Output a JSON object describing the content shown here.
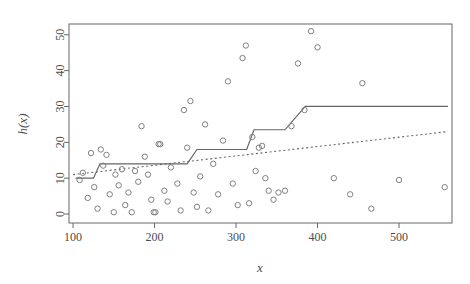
{
  "chart_data": {
    "type": "scatter",
    "title": "",
    "xlabel": "x",
    "ylabel": "h(x)",
    "xlim": [
      95,
      565
    ],
    "ylim": [
      -2.5,
      53
    ],
    "xticks": [
      100,
      200,
      300,
      400,
      500
    ],
    "yticks": [
      0,
      10,
      20,
      30,
      40,
      50
    ],
    "grid": false,
    "legend": null,
    "box": true,
    "point_symbol": "open-circle",
    "point_color": "#808080",
    "points": [
      {
        "x": 108,
        "y": 9.5
      },
      {
        "x": 112,
        "y": 11.5
      },
      {
        "x": 118,
        "y": 4.5
      },
      {
        "x": 122,
        "y": 17.0
      },
      {
        "x": 126,
        "y": 7.5
      },
      {
        "x": 130,
        "y": 1.5
      },
      {
        "x": 134,
        "y": 18.0
      },
      {
        "x": 137,
        "y": 13.5
      },
      {
        "x": 141,
        "y": 16.5
      },
      {
        "x": 145,
        "y": 5.5
      },
      {
        "x": 150,
        "y": 0.5
      },
      {
        "x": 152,
        "y": 11.0
      },
      {
        "x": 156,
        "y": 8.0
      },
      {
        "x": 160,
        "y": 12.5
      },
      {
        "x": 164,
        "y": 2.5
      },
      {
        "x": 168,
        "y": 6.0
      },
      {
        "x": 172,
        "y": 0.5
      },
      {
        "x": 176,
        "y": 12.0
      },
      {
        "x": 180,
        "y": 9.0
      },
      {
        "x": 184,
        "y": 24.5
      },
      {
        "x": 188,
        "y": 16.0
      },
      {
        "x": 192,
        "y": 11.0
      },
      {
        "x": 196,
        "y": 4.0
      },
      {
        "x": 199,
        "y": 0.5
      },
      {
        "x": 201,
        "y": 0.5
      },
      {
        "x": 205,
        "y": 19.5
      },
      {
        "x": 207,
        "y": 19.5
      },
      {
        "x": 212,
        "y": 6.5
      },
      {
        "x": 216,
        "y": 3.5
      },
      {
        "x": 220,
        "y": 13.0
      },
      {
        "x": 228,
        "y": 8.5
      },
      {
        "x": 232,
        "y": 1.0
      },
      {
        "x": 236,
        "y": 29.0
      },
      {
        "x": 240,
        "y": 18.5
      },
      {
        "x": 244,
        "y": 31.5
      },
      {
        "x": 248,
        "y": 6.0
      },
      {
        "x": 252,
        "y": 2.0
      },
      {
        "x": 256,
        "y": 10.5
      },
      {
        "x": 262,
        "y": 25.0
      },
      {
        "x": 266,
        "y": 1.0
      },
      {
        "x": 272,
        "y": 14.0
      },
      {
        "x": 278,
        "y": 5.5
      },
      {
        "x": 284,
        "y": 20.5
      },
      {
        "x": 290,
        "y": 37.0
      },
      {
        "x": 296,
        "y": 8.5
      },
      {
        "x": 302,
        "y": 2.5
      },
      {
        "x": 308,
        "y": 43.5
      },
      {
        "x": 312,
        "y": 47.0
      },
      {
        "x": 316,
        "y": 3.0
      },
      {
        "x": 320,
        "y": 21.5
      },
      {
        "x": 324,
        "y": 12.0
      },
      {
        "x": 328,
        "y": 18.5
      },
      {
        "x": 332,
        "y": 19.0
      },
      {
        "x": 336,
        "y": 10.0
      },
      {
        "x": 340,
        "y": 6.5
      },
      {
        "x": 346,
        "y": 4.0
      },
      {
        "x": 352,
        "y": 6.0
      },
      {
        "x": 360,
        "y": 6.5
      },
      {
        "x": 368,
        "y": 24.5
      },
      {
        "x": 376,
        "y": 42.0
      },
      {
        "x": 384,
        "y": 29.0
      },
      {
        "x": 392,
        "y": 51.0
      },
      {
        "x": 400,
        "y": 46.5
      },
      {
        "x": 420,
        "y": 10.0
      },
      {
        "x": 440,
        "y": 5.5
      },
      {
        "x": 455,
        "y": 36.5
      },
      {
        "x": 466,
        "y": 1.5
      },
      {
        "x": 500,
        "y": 9.5
      },
      {
        "x": 556,
        "y": 7.5
      }
    ],
    "series": [
      {
        "name": "step-function",
        "type": "step",
        "style": "solid",
        "color": "#666666",
        "width": 1.2,
        "knots": [
          {
            "x": 103,
            "y": 10.0
          },
          {
            "x": 125,
            "y": 10.0
          },
          {
            "x": 133,
            "y": 14.0
          },
          {
            "x": 240,
            "y": 14.0
          },
          {
            "x": 252,
            "y": 18.0
          },
          {
            "x": 313,
            "y": 18.0
          },
          {
            "x": 322,
            "y": 23.5
          },
          {
            "x": 360,
            "y": 23.5
          },
          {
            "x": 385,
            "y": 30.0
          },
          {
            "x": 560,
            "y": 30.0
          }
        ]
      },
      {
        "name": "linear-fit",
        "type": "line",
        "style": "dashed",
        "color": "#666666",
        "width": 1.1,
        "endpoints": [
          {
            "x": 100,
            "y": 11.0
          },
          {
            "x": 560,
            "y": 23.0
          }
        ]
      }
    ]
  },
  "axes": {
    "y_label": "h(x)",
    "x_label": "x",
    "x_tick_labels": [
      "100",
      "200",
      "300",
      "400",
      "500"
    ],
    "y_tick_labels": [
      "0",
      "10",
      "20",
      "30",
      "40",
      "50"
    ]
  },
  "colors": {
    "background": "#ffffff",
    "frame": "#666666",
    "point": "#808080",
    "text": "#4d4d4d",
    "step_line": "#666666",
    "fit_line": "#666666"
  }
}
